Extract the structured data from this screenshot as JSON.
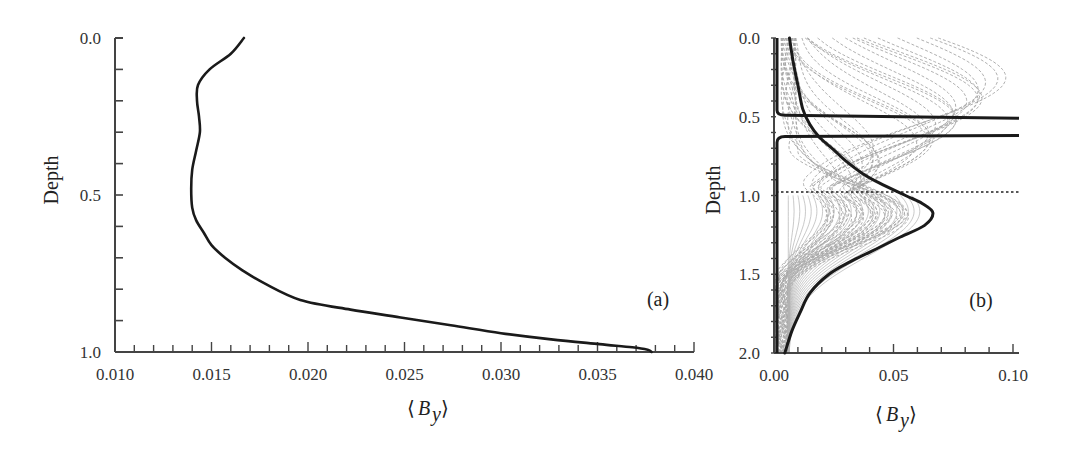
{
  "chart_data": [
    {
      "panel": "(a)",
      "type": "line",
      "title": "",
      "xlabel": "⟨B_y⟩",
      "ylabel": "Depth",
      "xlim": [
        0.01,
        0.04
      ],
      "ylim": [
        1.0,
        0.0
      ],
      "y_inverted": true,
      "grid": false,
      "x_ticks": [
        "0.010",
        "0.015",
        "0.020",
        "0.025",
        "0.030",
        "0.035",
        "0.040"
      ],
      "y_ticks": [
        "0.0",
        "0.5",
        "1.0"
      ],
      "x_minor_step": 0.001,
      "y_minor_step": 0.1,
      "series": [
        {
          "name": "mean By profile",
          "x": [
            0.01668,
            0.016,
            0.0149,
            0.0143,
            0.01425,
            0.01435,
            0.0144,
            0.0142,
            0.014,
            0.01395,
            0.014,
            0.0142,
            0.0146,
            0.015,
            0.0157,
            0.0166,
            0.0177,
            0.0196,
            0.0222,
            0.0248,
            0.0274,
            0.03,
            0.0326,
            0.0351,
            0.0368,
            0.0376,
            0.0378
          ],
          "y": [
            0.0,
            0.05,
            0.1,
            0.15,
            0.2,
            0.25,
            0.3,
            0.36,
            0.42,
            0.48,
            0.54,
            0.58,
            0.62,
            0.66,
            0.7,
            0.74,
            0.78,
            0.834,
            0.865,
            0.89,
            0.915,
            0.94,
            0.96,
            0.975,
            0.985,
            0.993,
            1.0
          ]
        }
      ]
    },
    {
      "panel": "(b)",
      "type": "line",
      "title": "",
      "xlabel": "⟨B_y⟩",
      "ylabel": "Depth",
      "xlim": [
        0.0,
        0.1
      ],
      "ylim": [
        2.0,
        0.0
      ],
      "y_inverted": true,
      "grid": false,
      "x_ticks": [
        "0.00",
        "0.05",
        "0.10"
      ],
      "y_ticks": [
        "0.0",
        "0.5",
        "1.0",
        "1.5",
        "2.0"
      ],
      "x_minor_step": 0.01,
      "y_minor_step": 0.1,
      "reference_line": {
        "depth": 1.0,
        "style": "dotted"
      },
      "series": [
        {
          "name": "final profile (heavy)",
          "x": [
            0.0065,
            0.008,
            0.01,
            0.012,
            0.015,
            0.019,
            0.025,
            0.03,
            0.037,
            0.044,
            0.055,
            0.062,
            0.0665,
            0.063,
            0.052,
            0.044,
            0.032,
            0.023,
            0.015,
            0.011,
            0.0075,
            0.0045
          ],
          "y": [
            0.0,
            0.15,
            0.3,
            0.45,
            0.55,
            0.63,
            0.71,
            0.78,
            0.86,
            0.92,
            1.0,
            1.05,
            1.11,
            1.19,
            1.27,
            1.33,
            1.42,
            1.5,
            1.62,
            1.74,
            1.86,
            2.0
          ]
        },
        {
          "name": "boundary layer profile (heavy, near-wall)",
          "x": [
            0.001,
            0.001,
            0.002,
            0.1
          ],
          "y": [
            0.0,
            0.47,
            0.49,
            0.52
          ],
          "segment2": {
            "x": [
              0.1,
              0.002,
              0.001,
              0.001
            ],
            "y": [
              0.62,
              0.63,
              0.66,
              2.0
            ]
          }
        },
        {
          "name": "intermediate profiles (thin gray, dashed)",
          "count": "~40",
          "description": "family of transient profiles between initial and final states"
        }
      ]
    }
  ],
  "labels": {
    "a": {
      "ylabel": "Depth",
      "xlabel_main": "B",
      "xlabel_sub": "y",
      "panel": "(a)",
      "xticks": [
        "0.010",
        "0.015",
        "0.020",
        "0.025",
        "0.030",
        "0.035",
        "0.040"
      ],
      "yticks": [
        "0.0",
        "0.5",
        "1.0"
      ]
    },
    "b": {
      "ylabel": "Depth",
      "xlabel_main": "B",
      "xlabel_sub": "y",
      "panel": "(b)",
      "xticks": [
        "0.00",
        "0.05",
        "0.10"
      ],
      "yticks": [
        "0.0",
        "0.5",
        "1.0",
        "1.5",
        "2.0"
      ]
    }
  },
  "colors": {
    "axis": "#444444",
    "heavy_curve": "#1a1a1a",
    "thin_curve": "#8a8a8a"
  }
}
